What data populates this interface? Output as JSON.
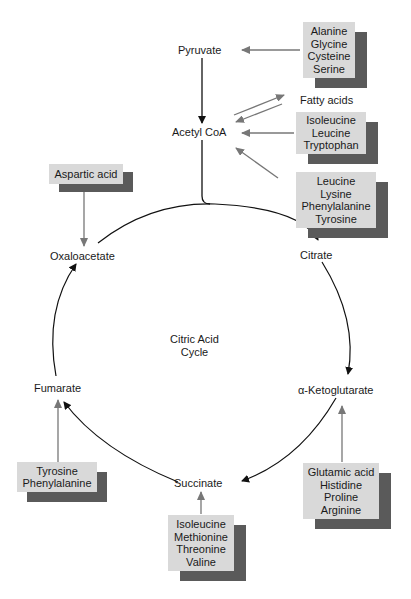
{
  "diagram": {
    "title": "Citric Acid Cycle",
    "center_label": [
      "Citric Acid",
      "Cycle"
    ],
    "nodes": {
      "pyruvate": "Pyruvate",
      "acetyl_coa": "Acetyl CoA",
      "fatty_acids": "Fatty acids",
      "citrate": "Citrate",
      "alpha_ketoglutarate": "α-Ketoglutarate",
      "succinate": "Succinate",
      "fumarate": "Fumarate",
      "oxaloacetate": "Oxaloacetate"
    },
    "boxes": {
      "to_pyruvate": [
        "Alanine",
        "Glycine",
        "Cysteine",
        "Serine"
      ],
      "to_acetyl_coa_1": [
        "Isoleucine",
        "Leucine",
        "Tryptophan"
      ],
      "to_acetyl_coa_2": [
        "Leucine",
        "Lysine",
        "Phenylalanine",
        "Tyrosine"
      ],
      "to_oxaloacetate": [
        "Aspartic acid"
      ],
      "to_fumarate": [
        "Tyrosine",
        "Phenylalanine"
      ],
      "to_succinate": [
        "Isoleucine",
        "Methionine",
        "Threonine",
        "Valine"
      ],
      "to_alpha_ketoglutarate": [
        "Glutamic acid",
        "Histidine",
        "Proline",
        "Arginine"
      ]
    },
    "colors": {
      "box_face": "#d9d9d9",
      "box_shadow": "#5a5a5a",
      "gray_arrow": "#777777",
      "black_arrow": "#111111"
    }
  }
}
